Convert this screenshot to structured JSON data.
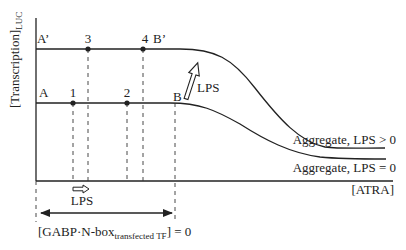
{
  "colors": {
    "ink": "#222222",
    "background": "#ffffff"
  },
  "axes": {
    "y_label": "[Transcription]",
    "y_label_sub": "LUC",
    "x_label": "[ATRA]"
  },
  "curves": {
    "upper": {
      "start_label": "A’",
      "end_label": "B’",
      "tail_label": "Aggregate, LPS > 0"
    },
    "lower": {
      "start_label": "A",
      "end_label": "B",
      "tail_label": "Aggregate, LPS = 0"
    }
  },
  "points": [
    {
      "id": "1",
      "label": "1",
      "curve": "lower"
    },
    {
      "id": "2",
      "label": "2",
      "curve": "lower"
    },
    {
      "id": "3",
      "label": "3",
      "curve": "upper"
    },
    {
      "id": "4",
      "label": "4",
      "curve": "upper"
    }
  ],
  "annotations": {
    "shift_arrow_label": "LPS",
    "lift_arrow_label": "LPS",
    "range_label_main": "[GABP·N-box",
    "range_label_sub": "transfected TF",
    "range_label_tail": "] = 0"
  }
}
